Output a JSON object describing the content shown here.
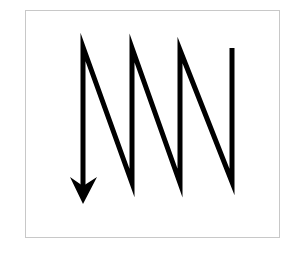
{
  "diagram": {
    "type": "zigzag-scan-path",
    "colors": {
      "stroke": "#000000",
      "frame_border": "#c8c8c8",
      "background": "#ffffff"
    },
    "stroke_width": 5,
    "path_points": [
      [
        232,
        48
      ],
      [
        232,
        182
      ],
      [
        180,
        50
      ],
      [
        180,
        183
      ],
      [
        132,
        48
      ],
      [
        132,
        183
      ],
      [
        83,
        47
      ],
      [
        83,
        190
      ]
    ],
    "arrowhead": {
      "direction": "down",
      "tip": [
        83,
        204
      ],
      "left": [
        70,
        177
      ],
      "right": [
        97,
        177
      ],
      "notch": [
        83,
        186
      ]
    }
  }
}
